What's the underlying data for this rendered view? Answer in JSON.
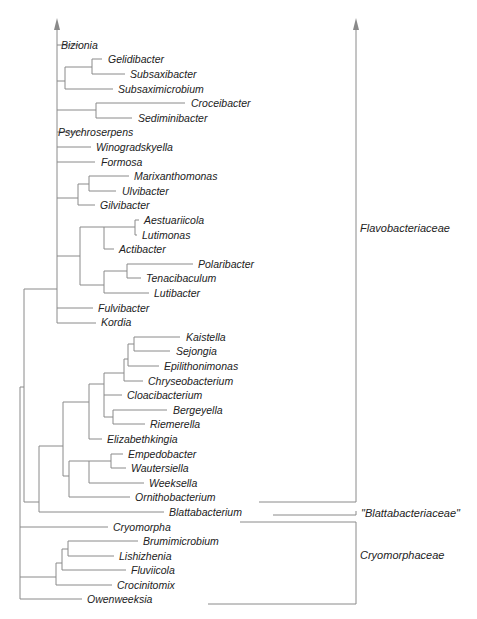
{
  "figure": {
    "type": "phylogenetic-tree",
    "line_color": "#8a8a8a",
    "text_color": "#222222"
  },
  "taxa": [
    {
      "name": "Bizionia",
      "x": 61,
      "y": 45
    },
    {
      "name": "Gelidibacter",
      "x": 108,
      "y": 59
    },
    {
      "name": "Subsaxibacter",
      "x": 130,
      "y": 74
    },
    {
      "name": "Subsaximicrobium",
      "x": 118,
      "y": 89
    },
    {
      "name": "Croceibacter",
      "x": 191,
      "y": 103
    },
    {
      "name": "Sediminibacter",
      "x": 138,
      "y": 118
    },
    {
      "name": "Psychroserpens",
      "x": 58,
      "y": 132
    },
    {
      "name": "Winogradskyella",
      "x": 96,
      "y": 147
    },
    {
      "name": "Formosa",
      "x": 101,
      "y": 162
    },
    {
      "name": "Marixanthomonas",
      "x": 134,
      "y": 176
    },
    {
      "name": "Ulvibacter",
      "x": 122,
      "y": 191
    },
    {
      "name": "Gilvibacter",
      "x": 100,
      "y": 205
    },
    {
      "name": "Aestuariicola",
      "x": 144,
      "y": 220
    },
    {
      "name": "Lutimonas",
      "x": 142,
      "y": 235
    },
    {
      "name": "Actibacter",
      "x": 119,
      "y": 249
    },
    {
      "name": "Polaribacter",
      "x": 198,
      "y": 264
    },
    {
      "name": "Tenacibaculum",
      "x": 146,
      "y": 278
    },
    {
      "name": "Lutibacter",
      "x": 154,
      "y": 293
    },
    {
      "name": "Fulvibacter",
      "x": 98,
      "y": 308
    },
    {
      "name": "Kordia",
      "x": 101,
      "y": 322
    },
    {
      "name": "Kaistella",
      "x": 186,
      "y": 337
    },
    {
      "name": "Sejongia",
      "x": 176,
      "y": 351
    },
    {
      "name": "Epilithonimonas",
      "x": 164,
      "y": 366
    },
    {
      "name": "Chryseobacterium",
      "x": 148,
      "y": 381
    },
    {
      "name": "Cloacibacterium",
      "x": 127,
      "y": 395
    },
    {
      "name": "Bergeyella",
      "x": 173,
      "y": 410
    },
    {
      "name": "Riemerella",
      "x": 150,
      "y": 424
    },
    {
      "name": "Elizabethkingia",
      "x": 107,
      "y": 439
    },
    {
      "name": "Empedobacter",
      "x": 128,
      "y": 454
    },
    {
      "name": "Wautersiella",
      "x": 131,
      "y": 468
    },
    {
      "name": "Weeksella",
      "x": 149,
      "y": 483
    },
    {
      "name": "Ornithobacterium",
      "x": 135,
      "y": 497
    },
    {
      "name": "Blattabacterium",
      "x": 169,
      "y": 512
    },
    {
      "name": "Cryomorpha",
      "x": 113,
      "y": 527
    },
    {
      "name": "Brumimicrobium",
      "x": 143,
      "y": 541
    },
    {
      "name": "Lishizhenia",
      "x": 119,
      "y": 556
    },
    {
      "name": "Fluviicola",
      "x": 131,
      "y": 570
    },
    {
      "name": "Crocinitomix",
      "x": 117,
      "y": 585
    },
    {
      "name": "Owenweeksia",
      "x": 87,
      "y": 599
    }
  ],
  "families": [
    {
      "name": "Flavobacteriaceae",
      "x": 360,
      "y": 228
    },
    {
      "name": "\"Blattabacteriaceae\"",
      "x": 361,
      "y": 513
    },
    {
      "name": "Cryomorphaceae",
      "x": 360,
      "y": 555
    }
  ]
}
